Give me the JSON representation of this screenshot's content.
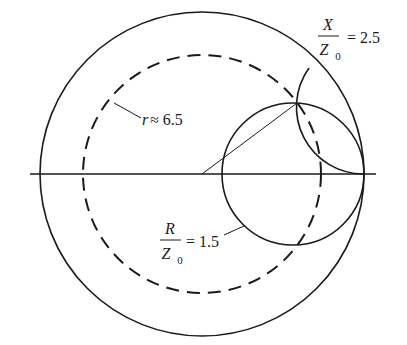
{
  "diagram": {
    "type": "smith-chart-circle-construction",
    "colors": {
      "stroke": "#1a1a1a",
      "background": "#ffffff"
    },
    "labels": {
      "x_reactance": {
        "num": "X",
        "den": "Z",
        "den_sub": "0",
        "eq": "= 2.5"
      },
      "r_resistance": {
        "num": "R",
        "den": "Z",
        "den_sub": "0",
        "eq": "= 1.5"
      },
      "radius": {
        "var": "r",
        "eq": "≈ 6.5"
      }
    },
    "elements": {
      "outer_circle": {
        "cx": 202,
        "cy": 174,
        "r": 162,
        "style": "solid"
      },
      "dashed_circle": {
        "cx": 202,
        "cy": 174,
        "r": 119,
        "style": "dashed"
      },
      "resistance_circle": {
        "cx": 293,
        "cy": 174,
        "r": 71,
        "style": "solid",
        "value": "R/Z0 = 1.5"
      },
      "reactance_arc": {
        "cx": 364,
        "cy": 107,
        "r": 67,
        "style": "solid",
        "value": "X/Z0 = 2.5"
      },
      "horizontal_axis": {
        "x1": 30,
        "x2": 376,
        "y": 174
      },
      "radius_line": {
        "x1": 202,
        "y1": 174,
        "x2": 297,
        "y2": 103
      }
    }
  }
}
